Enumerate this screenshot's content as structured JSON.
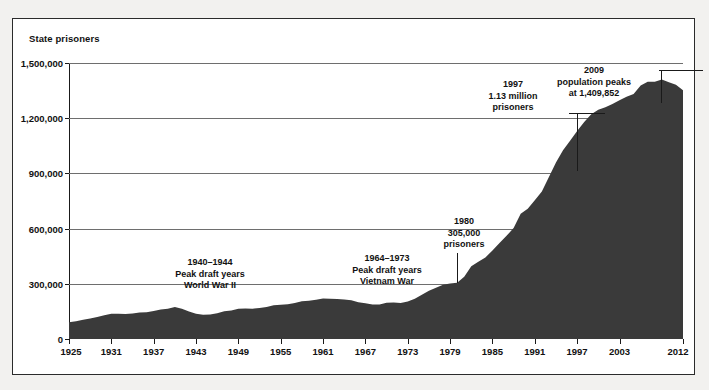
{
  "chart_data": {
    "type": "area",
    "title": "",
    "ylabel": "State prisoners",
    "xlabel": "",
    "ylim": [
      0,
      1500000
    ],
    "xlim": [
      1925,
      2012
    ],
    "grid": true,
    "legend": "none",
    "fill_color": "#3a3a3a",
    "ytick_labels": [
      "1,500,000",
      "1,200,000",
      "900,000",
      "600,000",
      "300,000",
      "0"
    ],
    "ytick_values": [
      1500000,
      1200000,
      900000,
      600000,
      300000,
      0
    ],
    "xtick_labels": [
      "1925",
      "1931",
      "1937",
      "1943",
      "1949",
      "1955",
      "1961",
      "1967",
      "1973",
      "1979",
      "1985",
      "1991",
      "1997",
      "2003",
      "2012"
    ],
    "xtick_values": [
      1925,
      1931,
      1937,
      1943,
      1949,
      1955,
      1961,
      1967,
      1973,
      1979,
      1985,
      1991,
      1997,
      2003,
      2012
    ],
    "x": [
      1925,
      1926,
      1927,
      1928,
      1929,
      1930,
      1931,
      1932,
      1933,
      1934,
      1935,
      1936,
      1937,
      1938,
      1939,
      1940,
      1941,
      1942,
      1943,
      1944,
      1945,
      1946,
      1947,
      1948,
      1949,
      1950,
      1951,
      1952,
      1953,
      1954,
      1955,
      1956,
      1957,
      1958,
      1959,
      1960,
      1961,
      1962,
      1963,
      1964,
      1965,
      1966,
      1967,
      1968,
      1969,
      1970,
      1971,
      1972,
      1973,
      1974,
      1975,
      1976,
      1977,
      1978,
      1979,
      1980,
      1981,
      1982,
      1983,
      1984,
      1985,
      1986,
      1987,
      1988,
      1989,
      1990,
      1991,
      1992,
      1993,
      1994,
      1995,
      1996,
      1997,
      1998,
      1999,
      2000,
      2001,
      2002,
      2003,
      2004,
      2005,
      2006,
      2007,
      2008,
      2009,
      2010,
      2011,
      2012
    ],
    "values": [
      91669,
      97000,
      104000,
      112000,
      120000,
      129453,
      137000,
      137000,
      136000,
      138000,
      144000,
      145000,
      152000,
      160000,
      165000,
      173706,
      165000,
      150000,
      137000,
      132000,
      133649,
      140000,
      151000,
      155000,
      163749,
      166123,
      165000,
      168000,
      173579,
      182901,
      185780,
      189000,
      195000,
      205643,
      208105,
      212953,
      220149,
      218830,
      217283,
      214336,
      210895,
      199654,
      194896,
      187914,
      187000,
      196429,
      198061,
      196092,
      204211,
      218466,
      240593,
      262833,
      278141,
      294396,
      301470,
      305458,
      338965,
      395516,
      419820,
      443398,
      480568,
      522084,
      560812,
      603732,
      680907,
      708393,
      753956,
      802241,
      880000,
      958704,
      1025624,
      1077824,
      1130000,
      1178978,
      1222000,
      1245845,
      1259481,
      1277127,
      1296986,
      1316772,
      1330980,
      1377815,
      1398698,
      1398000,
      1409852,
      1395000,
      1382418,
      1352000
    ],
    "annotations": [
      {
        "id": "wwii",
        "lines": [
          "1940–1944",
          "Peak draft years",
          "World War II"
        ]
      },
      {
        "id": "vietnam",
        "lines": [
          "1964–1973",
          "Peak draft years",
          "Vietnam War"
        ]
      },
      {
        "id": "y1980",
        "lines": [
          "1980",
          "305,000",
          "prisoners"
        ],
        "year": 1980,
        "value": 305000
      },
      {
        "id": "y1997",
        "lines": [
          "1997",
          "1.13 million",
          "prisoners"
        ],
        "year": 1997,
        "value": 1130000
      },
      {
        "id": "y2009",
        "lines": [
          "2009",
          "population peaks",
          "at 1,409,852"
        ],
        "year": 2009,
        "value": 1409852
      }
    ]
  }
}
